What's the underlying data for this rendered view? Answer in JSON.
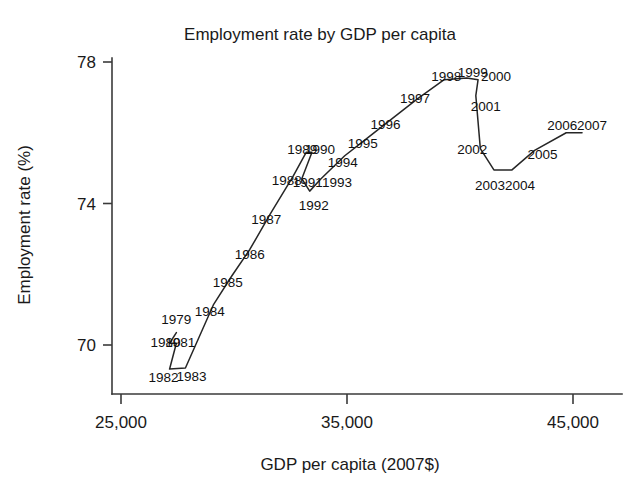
{
  "chart_data": {
    "type": "line",
    "title": "Employment rate by GDP per capita",
    "xlabel": "GDP per capita (2007$)",
    "ylabel": "Employment rate (%)",
    "xlim": [
      24200,
      47500
    ],
    "ylim": [
      69.0,
      78.4
    ],
    "grid": false,
    "legend": null,
    "xticks": [
      25000,
      35000,
      45000
    ],
    "xtick_labels": [
      "25,000",
      "35,000",
      "45,000"
    ],
    "yticks": [
      70,
      74,
      78
    ],
    "ytick_labels": [
      "70",
      "74",
      "78"
    ],
    "point_label_field": "year",
    "series": [
      {
        "name": "Employment rate vs GDP per capita",
        "color": "#262626",
        "points": [
          {
            "year": "1979",
            "x": 27450,
            "y": 70.35,
            "label_dx": 0,
            "label_dy": -9
          },
          {
            "year": "1980",
            "x": 27150,
            "y": 70.05,
            "label_dx": -4,
            "label_dy": 4
          },
          {
            "year": "1981",
            "x": 27450,
            "y": 70.05,
            "label_dx": 4,
            "label_dy": 4
          },
          {
            "year": "1982",
            "x": 27150,
            "y": 69.32,
            "label_dx": -6,
            "label_dy": 13
          },
          {
            "year": "1983",
            "x": 27850,
            "y": 69.35,
            "label_dx": 6,
            "label_dy": 13
          },
          {
            "year": "1984",
            "x": 29100,
            "y": 71.15,
            "label_dx": -4,
            "label_dy": 12
          },
          {
            "year": "1985",
            "x": 29900,
            "y": 71.95,
            "label_dx": -4,
            "label_dy": 11
          },
          {
            "year": "1986",
            "x": 30700,
            "y": 72.7,
            "label_dx": 0,
            "label_dy": 10
          },
          {
            "year": "1987",
            "x": 31600,
            "y": 73.7,
            "label_dx": -4,
            "label_dy": 10
          },
          {
            "year": "1988",
            "x": 32600,
            "y": 74.75,
            "label_dx": -6,
            "label_dy": 8
          },
          {
            "year": "1989",
            "x": 33200,
            "y": 75.45,
            "label_dx": -4,
            "label_dy": 2
          },
          {
            "year": "1990",
            "x": 33450,
            "y": 75.45,
            "label_dx": 8,
            "label_dy": 2
          },
          {
            "year": "1991",
            "x": 33000,
            "y": 74.7,
            "label_dx": 6,
            "label_dy": 8
          },
          {
            "year": "1992",
            "x": 33350,
            "y": 74.35,
            "label_dx": 4,
            "label_dy": 19
          },
          {
            "year": "1993",
            "x": 33850,
            "y": 74.7,
            "label_dx": 16,
            "label_dy": 8
          },
          {
            "year": "1994",
            "x": 34900,
            "y": 75.35,
            "label_dx": -2,
            "label_dy": 11
          },
          {
            "year": "1995",
            "x": 35700,
            "y": 75.75,
            "label_dx": 0,
            "label_dy": 6
          },
          {
            "year": "1996",
            "x": 36700,
            "y": 76.25,
            "label_dx": 0,
            "label_dy": 5
          },
          {
            "year": "1997",
            "x": 38100,
            "y": 76.95,
            "label_dx": -2,
            "label_dy": 4
          },
          {
            "year": "1998",
            "x": 39300,
            "y": 77.5,
            "label_dx": 2,
            "label_dy": 1
          },
          {
            "year": "1999",
            "x": 40300,
            "y": 77.55,
            "label_dx": 6,
            "label_dy": -1
          },
          {
            "year": "2000",
            "x": 40800,
            "y": 77.5,
            "label_dx": 18,
            "label_dy": 1
          },
          {
            "year": "2001",
            "x": 40700,
            "y": 77.05,
            "label_dx": 10,
            "label_dy": 15
          },
          {
            "year": "2002",
            "x": 40900,
            "y": 75.55,
            "label_dx": -8,
            "label_dy": 5
          },
          {
            "year": "2003",
            "x": 41500,
            "y": 74.95,
            "label_dx": -4,
            "label_dy": 20
          },
          {
            "year": "2004",
            "x": 42300,
            "y": 74.95,
            "label_dx": 8,
            "label_dy": 20
          },
          {
            "year": "2005",
            "x": 43300,
            "y": 75.5,
            "label_dx": 8,
            "label_dy": 9
          },
          {
            "year": "2006",
            "x": 44700,
            "y": 76.0,
            "label_dx": -4,
            "label_dy": -3
          },
          {
            "year": "2007",
            "x": 45400,
            "y": 76.0,
            "label_dx": 10,
            "label_dy": -3
          }
        ]
      }
    ]
  }
}
